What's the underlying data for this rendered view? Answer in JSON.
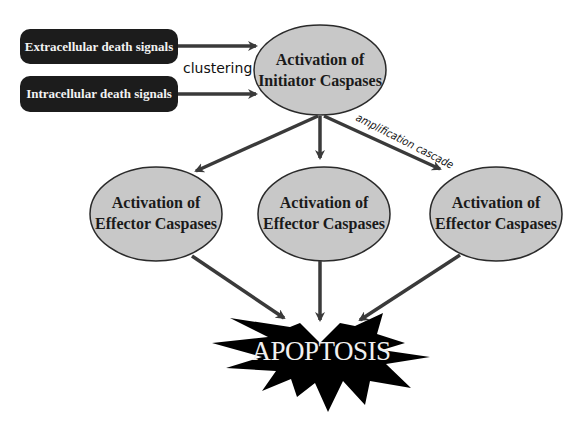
{
  "inputs": [
    {
      "label": "Extracellular death signals"
    },
    {
      "label": "Intracellular death signals"
    }
  ],
  "labels": {
    "clustering": "clustering",
    "amplification": "amplification cascade"
  },
  "initiator": {
    "line1": "Activation of",
    "line2": "Initiator Caspases"
  },
  "effectors": [
    {
      "line1": "Activation of",
      "line2": "Effector Caspases"
    },
    {
      "line1": "Activation of",
      "line2": "Effector Caspases"
    },
    {
      "line1": "Activation of",
      "line2": "Effector Caspases"
    }
  ],
  "outcome": {
    "label": "APOPTOSIS"
  },
  "colors": {
    "ellipse_fill": "#c8c8c8",
    "box_fill": "#1c1c1c",
    "arrow": "#3a3a3a",
    "burst": "#000000"
  }
}
